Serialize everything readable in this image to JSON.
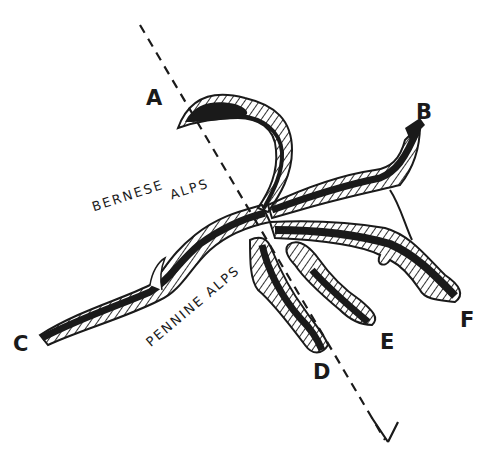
{
  "diagram": {
    "type": "hand-drawn glacier / valley map sketch",
    "colors": {
      "ink": "#1a1a1a",
      "background": "#ffffff"
    },
    "points": {
      "A": "A",
      "B": "B",
      "C": "C",
      "D": "D",
      "E": "E",
      "F": "F"
    },
    "regions": {
      "bernese_1": "BERNESE",
      "bernese_2": "ALPS",
      "pennine": "PENNINE ALPS"
    },
    "section_line": {
      "style": "dashed",
      "direction": "arrow toward lower right",
      "from": [
        140,
        25
      ],
      "to": [
        385,
        440
      ]
    }
  }
}
